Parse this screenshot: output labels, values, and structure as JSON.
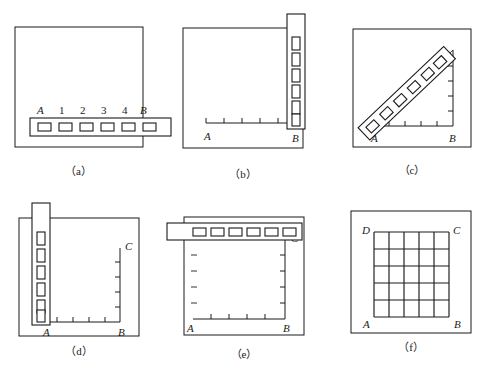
{
  "figure": {
    "panel_count": 6,
    "background_color": "#ffffff",
    "ink_color": "#1a1a1a"
  },
  "panels": [
    {
      "id": "a",
      "caption": "（a）",
      "description": "Square frame with a horizontal slotted ruler lying across the lower portion, extending past the right edge of the frame.",
      "ruler": {
        "orientation": "horizontal",
        "slot_count": 6,
        "slot_shape": "square",
        "extends_beyond_frame": true
      },
      "labels": {
        "left_point": "A",
        "right_point": "B",
        "intermediate": [
          "1",
          "2",
          "3",
          "4"
        ]
      },
      "axis": {
        "present": false,
        "tick_count": 0
      }
    },
    {
      "id": "b",
      "caption": "（b）",
      "description": "Square frame with a vertical slotted ruler standing on the right edge at B, extending above the frame top. A short horizontal tick axis runs along the bottom from A to B.",
      "ruler": {
        "orientation": "vertical",
        "slot_count": 6,
        "slot_shape": "square",
        "extends_beyond_frame": true
      },
      "labels": {
        "left_point": "A",
        "right_point": "B"
      },
      "axis": {
        "present": true,
        "orientation": "horizontal",
        "tick_count": 5,
        "tick_direction": "up"
      }
    },
    {
      "id": "c",
      "caption": "（c）",
      "description": "Square frame containing a right triangle: horizontal base A to B with upward ticks, vertical right leg at B with leftward ticks, and a diagonal slotted ruler laid along the hypotenuse from A upward to the right.",
      "ruler": {
        "orientation": "diagonal",
        "slot_count": 6,
        "slot_shape": "square-rotated",
        "extends_beyond_frame": false
      },
      "labels": {
        "left_point": "A",
        "right_point": "B"
      },
      "axis": {
        "present": true,
        "orientation": "both",
        "tick_count": 5,
        "tick_direction": "inward"
      }
    },
    {
      "id": "d",
      "caption": "（d）",
      "description": "Square frame with a vertical slotted ruler standing on the left edge at A, extending above the frame top. Horizontal axis runs A to B along the bottom; a vertical axis rises at B up to point C.",
      "ruler": {
        "orientation": "vertical",
        "slot_count": 6,
        "slot_shape": "square",
        "extends_beyond_frame": true
      },
      "labels": {
        "left_point": "A",
        "right_point": "B",
        "top_point": "C"
      },
      "axis": {
        "present": true,
        "orientation": "both",
        "tick_count": 5,
        "tick_direction": "inward"
      }
    },
    {
      "id": "e",
      "caption": "（e）",
      "description": "Square frame with a horizontal slotted ruler lying across the top, extending past the left edge. Horizontal axis A to B along the bottom, vertical axis at B rising to C, plus faint floating dash marks along the left interior.",
      "ruler": {
        "orientation": "horizontal",
        "slot_count": 6,
        "slot_shape": "square",
        "extends_beyond_frame": true
      },
      "labels": {
        "left_point": "A",
        "right_point": "B",
        "top_point": "C"
      },
      "axis": {
        "present": true,
        "orientation": "both",
        "tick_count": 5,
        "tick_direction": "inward"
      },
      "dash_marks": {
        "count": 4,
        "side": "left"
      }
    },
    {
      "id": "f",
      "caption": "（f）",
      "description": "Square frame containing a completed 5 by 5 square grid with corners labelled A bottom-left, B bottom-right, C top-right and D top-left.",
      "ruler": {
        "orientation": "none",
        "slot_count": 0,
        "slot_shape": "none",
        "extends_beyond_frame": false
      },
      "labels": {
        "bottom_left": "A",
        "bottom_right": "B",
        "top_right": "C",
        "top_left": "D"
      },
      "grid": {
        "rows": 5,
        "columns": 5
      }
    }
  ]
}
